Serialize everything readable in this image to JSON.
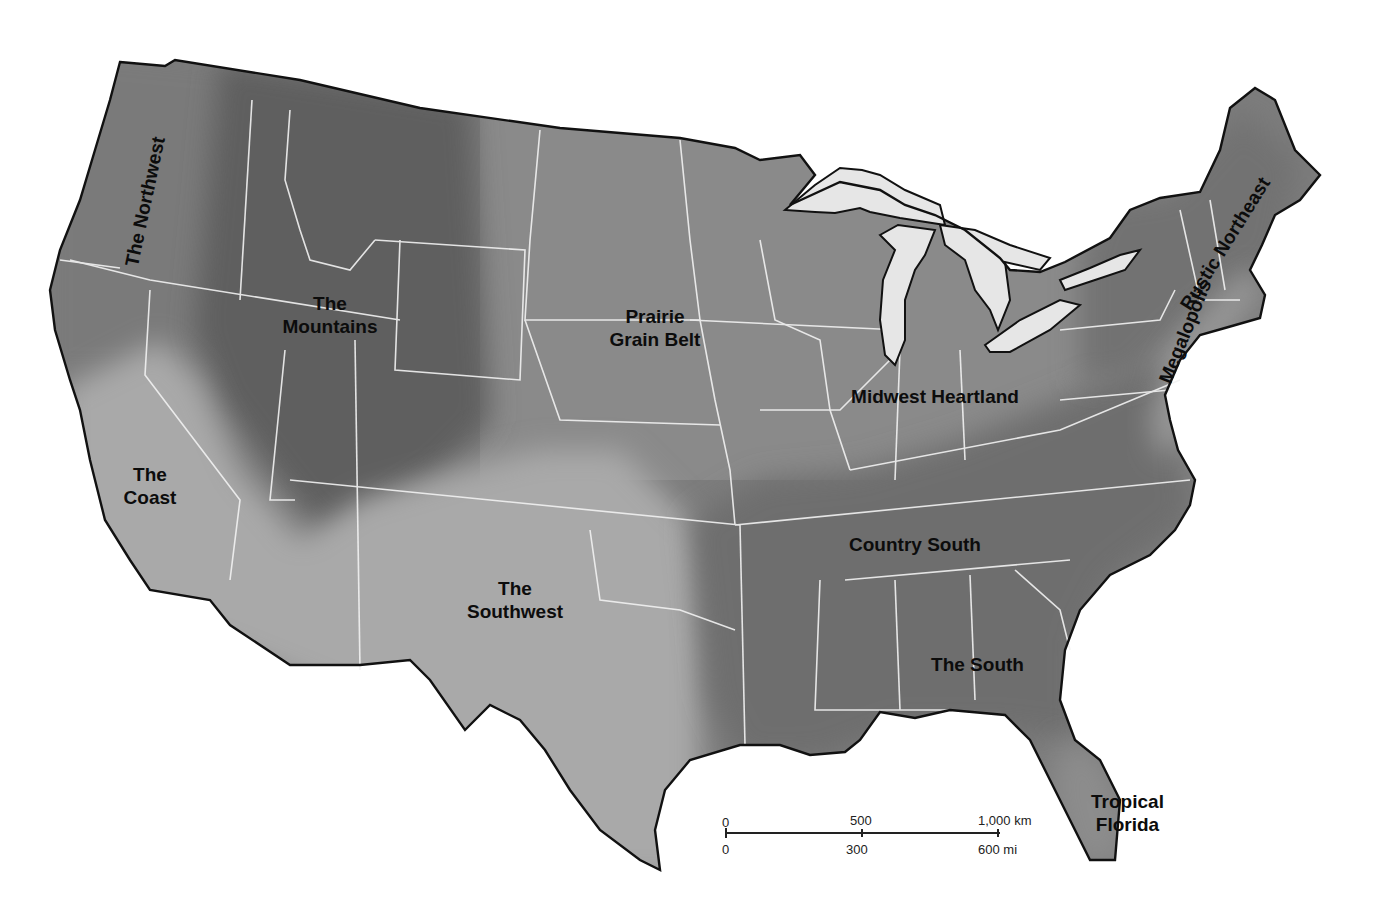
{
  "map": {
    "subject": "Cultural regions of the conterminous United States",
    "colors": {
      "background": "#ffffff",
      "state_border": "#f2f2f2",
      "coast_outline": "#111111",
      "lakes": "#e6e6e6",
      "darkest": "#5c5c5c",
      "dark": "#707070",
      "medium": "#888888",
      "light": "#a8a8a8",
      "label_text": "#0c0c0c"
    },
    "regions": [
      {
        "name": "The Northwest",
        "line1": "The Northwest",
        "shade": "medium-dark"
      },
      {
        "name": "The Mountains",
        "line1": "The",
        "line2": "Mountains",
        "shade": "darkest"
      },
      {
        "name": "The Coast",
        "line1": "The",
        "line2": "Coast",
        "shade": "light"
      },
      {
        "name": "The Southwest",
        "line1": "The",
        "line2": "Southwest",
        "shade": "light"
      },
      {
        "name": "Prairie Grain Belt",
        "line1": "Prairie",
        "line2": "Grain Belt",
        "shade": "medium"
      },
      {
        "name": "Midwest Heartland",
        "line1": "Midwest Heartland",
        "shade": "medium"
      },
      {
        "name": "Country South",
        "line1": "Country South",
        "shade": "dark"
      },
      {
        "name": "The South",
        "line1": "The South",
        "shade": "dark"
      },
      {
        "name": "Tropical Florida",
        "line1": "Tropical",
        "line2": "Florida",
        "shade": "medium"
      },
      {
        "name": "Rustic Northeast",
        "line1": "Rustic Northeast",
        "shade": "dark"
      },
      {
        "name": "Megalopolis",
        "line1": "Megalopolis",
        "shade": "light"
      }
    ],
    "scale_bar": {
      "km_ticks": [
        "0",
        "500",
        "1,000 km"
      ],
      "mi_ticks": [
        "0",
        "300",
        "600 mi"
      ]
    }
  }
}
